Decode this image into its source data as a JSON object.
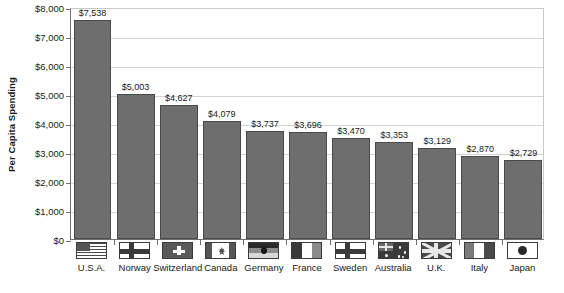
{
  "chart_data": {
    "type": "bar",
    "title": "",
    "xlabel": "",
    "ylabel": "Per Capita Spending",
    "ylim": [
      0,
      8000
    ],
    "grid": true,
    "legend": "none",
    "categories": [
      "U.S.A.",
      "Norway",
      "Switzerland",
      "Canada",
      "Germany",
      "France",
      "Sweden",
      "Australia",
      "U.K.",
      "Italy",
      "Japan"
    ],
    "values": [
      7538,
      5003,
      4627,
      4079,
      3737,
      3696,
      3470,
      3353,
      3129,
      2870,
      2729
    ],
    "value_labels": [
      "$7,538",
      "$5,003",
      "$4,627",
      "$4,079",
      "$3,737",
      "$3,696",
      "$3,470",
      "$3,353",
      "$3,129",
      "$2,870",
      "$2,729"
    ],
    "ytick_labels": [
      "$0",
      "$1,000",
      "$2,000",
      "$3,000",
      "$4,000",
      "$5,000",
      "$6,000",
      "$7,000",
      "$8,000"
    ],
    "ytick_values": [
      0,
      1000,
      2000,
      3000,
      4000,
      5000,
      6000,
      7000,
      8000
    ],
    "flags": [
      "flag-usa-icon",
      "flag-norway-icon",
      "flag-switzerland-icon",
      "flag-canada-icon",
      "flag-germany-icon",
      "flag-france-icon",
      "flag-sweden-icon",
      "flag-australia-icon",
      "flag-uk-icon",
      "flag-italy-icon",
      "flag-japan-icon"
    ],
    "colors": {
      "bar_fill": "#6e6e6e",
      "bar_stroke": "#4a4a4a",
      "gridline": "#d2d2d2",
      "axis": "#707070",
      "background": "#ffffff",
      "text": "#1a1a1a"
    }
  }
}
